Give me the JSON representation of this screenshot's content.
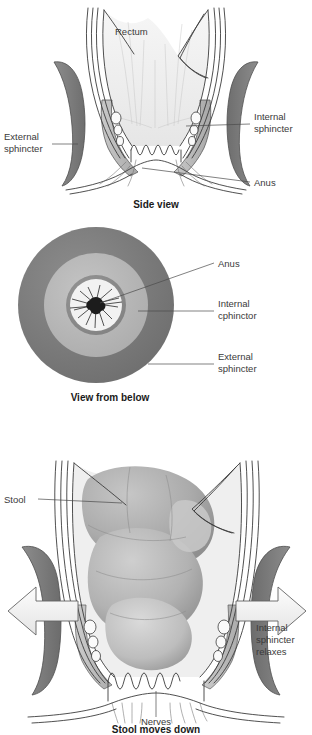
{
  "document": {
    "title": "Anorectal anatomy and defecation diagram",
    "panel_count": 3
  },
  "colors": {
    "external_sphincter": "#7d7d7d",
    "internal_sphincter": "#b6b6b6",
    "rectum_lumen": "#efefef",
    "stool": "#a9a9a9",
    "outline": "#3c3c3c",
    "label_text": "#3a3a3a",
    "caption_text": "#1a1a1a",
    "ring_outer": "#7b7b7b",
    "ring_mid": "#b9b9b9",
    "ring_inner": "#8e8e8e",
    "ring_core": "#f2f2f2",
    "arrow_fill": "#f4f4f4",
    "background": "#ffffff"
  },
  "panels": [
    {
      "id": "side-view",
      "caption": "Side view",
      "labels": [
        {
          "key": "rectum",
          "text": "Rectum",
          "position": "center-top"
        },
        {
          "key": "external_sphincter_line1",
          "text": "External",
          "position": "left"
        },
        {
          "key": "external_sphincter_line2",
          "text": "sphincter",
          "position": "left"
        },
        {
          "key": "internal_sphincter_line1",
          "text": "Internal",
          "position": "right"
        },
        {
          "key": "internal_sphincter_line2",
          "text": "sphincter",
          "position": "right"
        },
        {
          "key": "anus",
          "text": "Anus",
          "position": "right-lower"
        }
      ]
    },
    {
      "id": "below-view",
      "caption": "View from below",
      "labels": [
        {
          "key": "anus",
          "text": "Anus",
          "position": "right-top"
        },
        {
          "key": "internal_sphincter_line1",
          "text": "Internal",
          "position": "right-middle"
        },
        {
          "key": "internal_sphincter_line2",
          "text": "cphinctor",
          "position": "right-middle"
        },
        {
          "key": "external_sphincter_line1",
          "text": "External",
          "position": "right-lower"
        },
        {
          "key": "external_sphincter_line2",
          "text": "sphincter",
          "position": "right-lower"
        }
      ],
      "rings": [
        {
          "name": "external-sphincter-ring",
          "radius": 78
        },
        {
          "name": "internal-sphincter-ring",
          "radius": 52
        },
        {
          "name": "mucosa-ring",
          "radius": 30
        },
        {
          "name": "anal-opening-core",
          "radius": 26
        }
      ]
    },
    {
      "id": "stool-view",
      "caption": "Stool moves down",
      "labels": [
        {
          "key": "stool",
          "text": "Stool",
          "position": "left"
        },
        {
          "key": "nerves",
          "text": "Nerves",
          "position": "bottom-center"
        },
        {
          "key": "relax_line1",
          "text": "Internal",
          "position": "right"
        },
        {
          "key": "relax_line2",
          "text": "sphincter",
          "position": "right"
        },
        {
          "key": "relax_line3",
          "text": "relaxes",
          "position": "right"
        }
      ],
      "arrows": [
        {
          "name": "left-expansion-arrow",
          "direction": "left"
        },
        {
          "name": "right-expansion-arrow",
          "direction": "right"
        }
      ]
    }
  ]
}
